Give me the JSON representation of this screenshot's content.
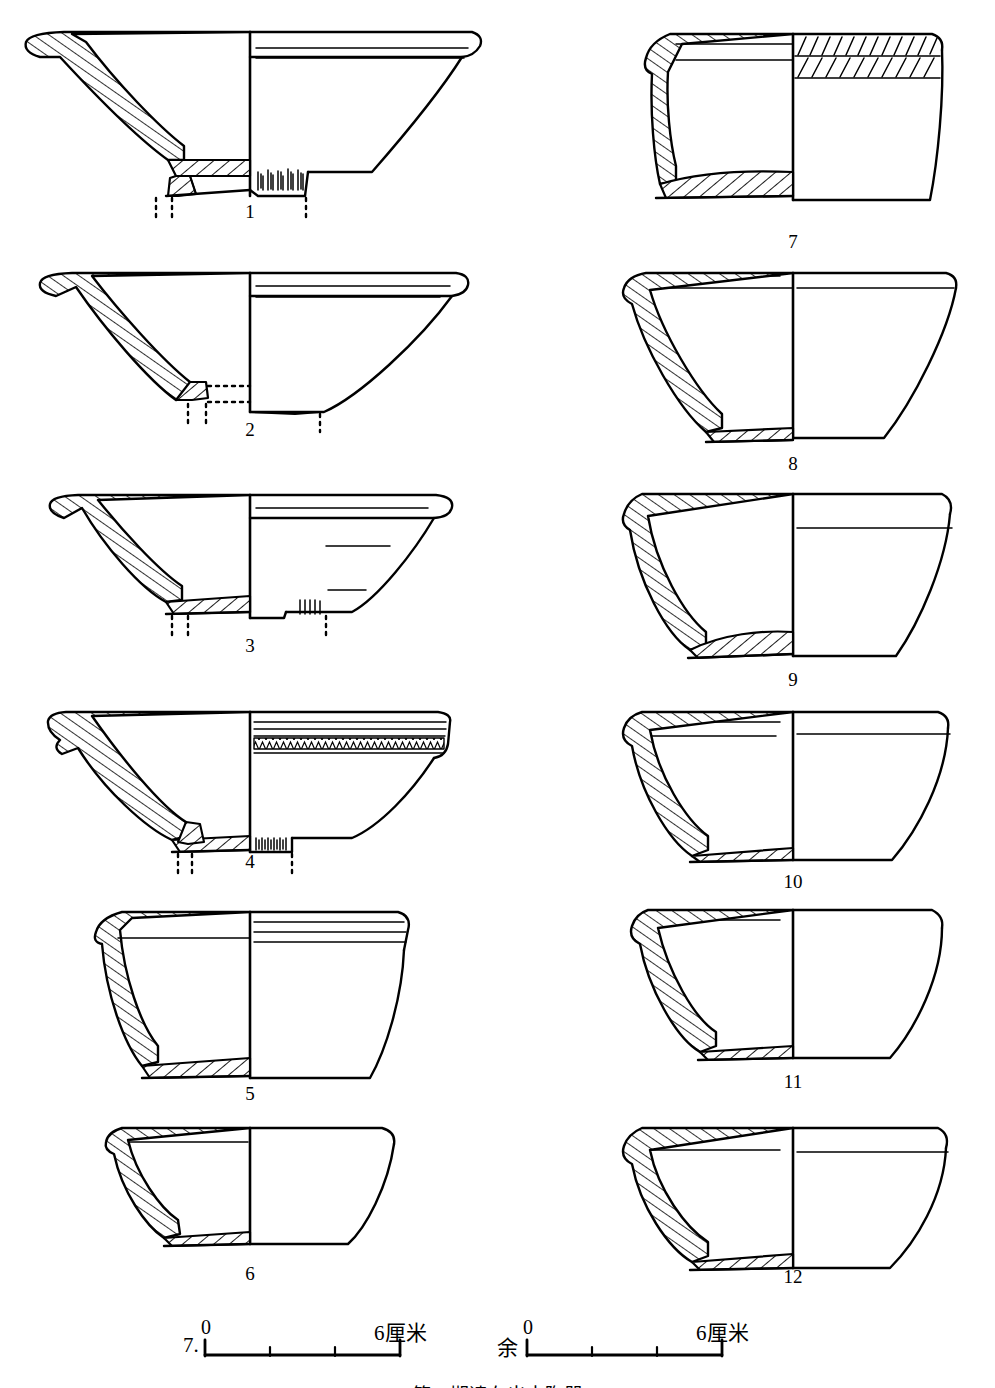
{
  "plate": {
    "kind": "archaeological-pottery-drawing-plate",
    "background_color": "#ffffff",
    "ink_color": "#000000",
    "width": 995,
    "height": 1388,
    "columns": 2,
    "caption": "第二期遗存出土陶器",
    "caption_visible": "partially-cropped"
  },
  "figure_numbers": [
    {
      "id": "1",
      "label": "1",
      "x": 250,
      "y": 210
    },
    {
      "id": "2",
      "label": "2",
      "x": 250,
      "y": 428
    },
    {
      "id": "3",
      "label": "3",
      "x": 250,
      "y": 645
    },
    {
      "id": "4",
      "label": "4",
      "x": 250,
      "y": 860
    },
    {
      "id": "5",
      "label": "5",
      "x": 250,
      "y": 1092
    },
    {
      "id": "6",
      "label": "6",
      "x": 250,
      "y": 1272
    },
    {
      "id": "7",
      "label": "7",
      "x": 793,
      "y": 240
    },
    {
      "id": "8",
      "label": "8",
      "x": 793,
      "y": 462
    },
    {
      "id": "9",
      "label": "9",
      "x": 793,
      "y": 678
    },
    {
      "id": "10",
      "label": "10",
      "x": 793,
      "y": 880
    },
    {
      "id": "11",
      "label": "11",
      "x": 793,
      "y": 1080
    },
    {
      "id": "12",
      "label": "12",
      "x": 793,
      "y": 1275
    }
  ],
  "scale_bars": [
    {
      "id": "scale-left",
      "prefix_label": "7.",
      "start_label": "0",
      "end_label": "6厘米",
      "unit": "厘米",
      "max_value": 6,
      "tick_count": 2,
      "bar_x": 205,
      "bar_y": 1345,
      "bar_width": 195
    },
    {
      "id": "scale-right",
      "prefix_label": "余",
      "start_label": "0",
      "end_label": "6厘米",
      "unit": "厘米",
      "max_value": 6,
      "tick_count": 2,
      "bar_x": 527,
      "bar_y": 1345,
      "bar_width": 195
    }
  ],
  "vessels": [
    {
      "id": "vessel-1",
      "number": "1",
      "type": "shallow-bowl-with-ring-foot",
      "column": "left",
      "description": "Wide shallow bowl, everted thickened rim, low ring foot, vertical striations on foot exterior",
      "section_hatch": "diagonal-ladder",
      "decoration": [
        "two horizontal rim lines",
        "vertical striations on foot"
      ],
      "reconstruction_dots": true
    },
    {
      "id": "vessel-2",
      "number": "2",
      "type": "shallow-dish-flat-flaring-rim",
      "column": "left",
      "description": "Very shallow wide dish with broad flat flaring rim, flat base reconstructed with dotted line",
      "section_hatch": "diagonal-ladder",
      "decoration": [
        "two horizontal rim lines"
      ],
      "reconstruction_dots": true
    },
    {
      "id": "vessel-3",
      "number": "3",
      "type": "shallow-bowl-with-ring-foot",
      "column": "left",
      "description": "Shallow bowl with everted rim, low ring foot, short horizontal surface marks on interior profile",
      "section_hatch": "diagonal-ladder",
      "decoration": [
        "horizontal tick marks",
        "vertical striations at foot"
      ],
      "reconstruction_dots": true
    },
    {
      "id": "vessel-4",
      "number": "4",
      "type": "shallow-bowl-with-decorated-band",
      "column": "left",
      "description": "Shallow bowl with grooved rim band and herringbone/chevron incised band below the rim, low ring foot",
      "section_hatch": "diagonal-ladder",
      "decoration": [
        "grooved bands",
        "herringbone incised band",
        "vertical striations at foot"
      ],
      "reconstruction_dots": true
    },
    {
      "id": "vessel-5",
      "number": "5",
      "type": "deep-cup-flat-base",
      "column": "left",
      "description": "Deep straight-sided cup with flat base and three horizontal grooves below the rim",
      "section_hatch": "diagonal-ladder",
      "decoration": [
        "three horizontal grooves below rim"
      ],
      "reconstruction_dots": false
    },
    {
      "id": "vessel-6",
      "number": "6",
      "type": "conical-bowl-flat-base",
      "column": "left",
      "description": "Small plain conical bowl with flat base, thin walls",
      "section_hatch": "diagonal-ladder",
      "decoration": [
        "single interior rim line"
      ],
      "reconstruction_dots": false
    },
    {
      "id": "vessel-7",
      "number": "7",
      "type": "deep-cup-hatched-decoration",
      "column": "right",
      "description": "Deep barrel-shaped cup, flat base; upper exterior covered with two bands of slanted comb-incised strokes",
      "section_hatch": "diagonal-ladder",
      "decoration": [
        "two bands of slanted incised strokes on upper exterior"
      ],
      "reconstruction_dots": false
    },
    {
      "id": "vessel-8",
      "number": "8",
      "type": "deep-bowl-flat-base",
      "column": "right",
      "description": "Wide deep bowl, straight flaring walls, flat base, plain surface",
      "section_hatch": "diagonal-ladder",
      "decoration": [
        "two horizontal rim lines"
      ],
      "reconstruction_dots": false
    },
    {
      "id": "vessel-9",
      "number": "9",
      "type": "deep-bowl-rounded-base",
      "column": "right",
      "description": "Deep bowl with straight walls and slightly rounded lower body, flat base",
      "section_hatch": "diagonal-ladder",
      "decoration": [
        "single horizontal rim line"
      ],
      "reconstruction_dots": false
    },
    {
      "id": "vessel-10",
      "number": "10",
      "type": "deep-bowl-flat-base",
      "column": "right",
      "description": "Deep bowl, flaring walls, flat base, two horizontal lines below rim",
      "section_hatch": "diagonal-ladder",
      "decoration": [
        "two horizontal lines below rim"
      ],
      "reconstruction_dots": false
    },
    {
      "id": "vessel-11",
      "number": "11",
      "type": "deep-bowl-flat-base",
      "column": "right",
      "description": "Deep bowl with slightly convex walls, flat base",
      "section_hatch": "diagonal-ladder",
      "decoration": [
        "single horizontal rim line"
      ],
      "reconstruction_dots": false
    },
    {
      "id": "vessel-12",
      "number": "12",
      "type": "deep-bowl-flat-base",
      "column": "right",
      "description": "Deep bowl with curved walls, flat base, one horizontal line below rim",
      "section_hatch": "diagonal-ladder",
      "decoration": [
        "one horizontal line below rim"
      ],
      "reconstruction_dots": false
    }
  ]
}
